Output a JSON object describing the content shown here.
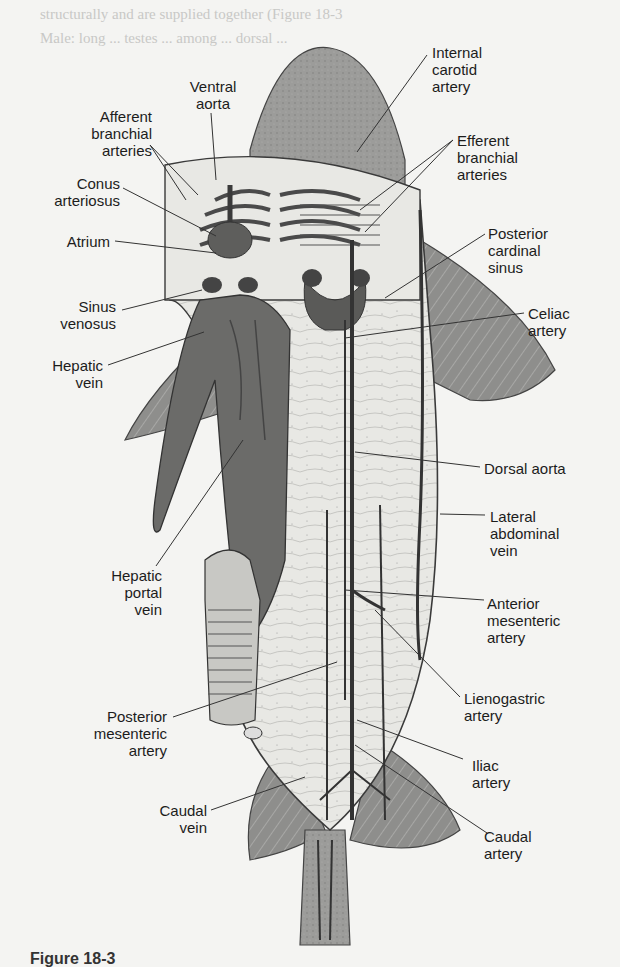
{
  "figure": {
    "bleed_through_text": [
      "structurally and are supplied together (Figure 18-3",
      "Male: long ... testes ... among ... dorsal ... ",
      "within ... ... (Figure 18-5",
      "They are ... ... ... ... ... ... ... ... ... ... or-",
      "chium ... ... ... ... ... ... ... ... ... ... ... ...",
      "ductus ... ... ... ... ... ... ... ... ... ... ..."
    ],
    "caption": "Figure 18-3"
  },
  "labels": {
    "afferent_branchial_arteries": "Afferent\nbranchial\narteries",
    "ventral_aorta": "Ventral\naorta",
    "internal_carotid_artery": "Internal\ncarotid\nartery",
    "efferent_branchial_arteries": "Efferent\nbranchial\narteries",
    "conus_arteriosus": "Conus\narteriosus",
    "atrium": "Atrium",
    "posterior_cardinal_sinus": "Posterior\ncardinal\nsinus",
    "sinus_venosus": "Sinus\nvenosus",
    "celiac_artery": "Celiac\nartery",
    "hepatic_vein": "Hepatic\nvein",
    "dorsal_aorta": "Dorsal aorta",
    "lateral_abdominal_vein": "Lateral\nabdominal\nvein",
    "hepatic_portal_vein": "Hepatic\nportal\nvein",
    "anterior_mesenteric_artery": "Anterior\nmesenteric\nartery",
    "lienogastric_artery": "Lienogastric\nartery",
    "posterior_mesenteric_artery": "Posterior\nmesenteric\nartery",
    "iliac_artery": "Iliac\nartery",
    "caudal_vein": "Caudal\nvein",
    "caudal_artery": "Caudal\nartery"
  },
  "colors": {
    "background": "#f4f4f2",
    "body_fill": "#9a9a98",
    "body_light": "#e6e6e2",
    "vessel_dark": "#3a3a3a",
    "organ_dark": "#5e5e5c",
    "leader_line": "#333333"
  }
}
